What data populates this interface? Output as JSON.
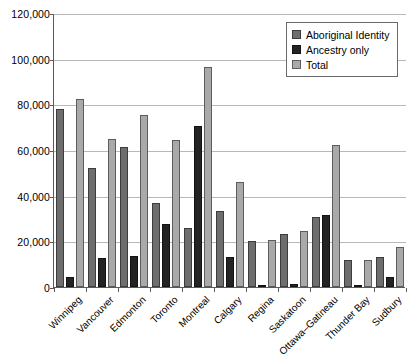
{
  "chart_data": {
    "type": "bar",
    "title": "",
    "subtitle": "",
    "xlabel": "",
    "ylabel": "",
    "ylim": [
      0,
      120000
    ],
    "ytick_values": [
      0,
      20000,
      40000,
      60000,
      80000,
      100000,
      120000
    ],
    "ytick_labels": [
      "0",
      "20,000",
      "40,000",
      "60,000",
      "80,000",
      "100,000",
      "120,000"
    ],
    "grid": true,
    "legend_position": "top-right",
    "categories": [
      "Winnipeg",
      "Vancouver",
      "Edmonton",
      "Toronto",
      "Montreal",
      "Calgary",
      "Regina",
      "Saskatoon",
      "Ottawa–Gatineau",
      "Thunder Bay",
      "Sudbury"
    ],
    "series": [
      {
        "name": "Aboriginal Identity",
        "color": "#6e6e6e",
        "values": [
          78000,
          52000,
          61500,
          37000,
          26000,
          33500,
          20000,
          23000,
          30500,
          12000,
          13000
        ]
      },
      {
        "name": "Ancestry only",
        "color": "#232323",
        "values": [
          4500,
          12500,
          13500,
          27500,
          70500,
          13000,
          1000,
          1500,
          31500,
          300,
          4500
        ]
      },
      {
        "name": "Total",
        "color": "#a9a9a9",
        "values": [
          82500,
          65000,
          75500,
          64500,
          96500,
          46000,
          20500,
          24500,
          62000,
          12000,
          17500
        ]
      }
    ]
  },
  "legend": {
    "items": [
      {
        "label": "Aboriginal Identity",
        "swatch": "identity"
      },
      {
        "label": "Ancestry only",
        "swatch": "ancestry"
      },
      {
        "label": "Total",
        "swatch": "total"
      }
    ]
  }
}
